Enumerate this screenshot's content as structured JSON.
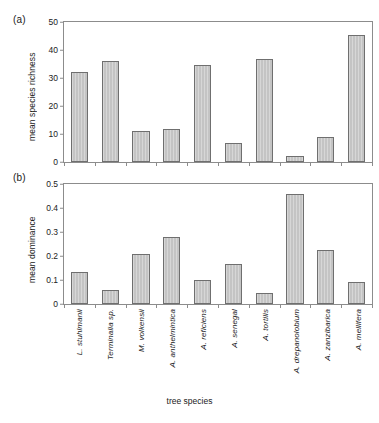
{
  "figure": {
    "panel_a_letter": "(a)",
    "panel_b_letter": "(b)",
    "xtitle": "tree species",
    "bar_color": "#c4c4c4",
    "bar_edge_color": "#6f6f6f",
    "axis_color": "#8c8c8c"
  },
  "chart_data": [
    {
      "type": "bar",
      "panel": "(a)",
      "title": "",
      "xlabel": "tree species",
      "ylabel": "mean species richness",
      "ylim": [
        0,
        50
      ],
      "yticks": [
        0,
        10,
        20,
        30,
        40,
        50
      ],
      "ytick_labels": [
        "0",
        "10",
        "20",
        "30",
        "40",
        "50"
      ],
      "grid": false,
      "legend": "none",
      "categories": [
        "L. stuhlmanii",
        "Terminalia sp.",
        "M. volkensii",
        "A. anthelmintica",
        "A. reficiens",
        "A. senegal",
        "A. tortilis",
        "A. drepanolobium",
        "A. zanzibarica",
        "A. mellifera"
      ],
      "values": [
        32.0,
        36.0,
        11.0,
        11.9,
        34.8,
        6.8,
        36.8,
        2.2,
        9.0,
        45.5
      ]
    },
    {
      "type": "bar",
      "panel": "(b)",
      "title": "",
      "xlabel": "tree species",
      "ylabel": "mean dominance",
      "ylim": [
        0,
        0.5
      ],
      "yticks": [
        0,
        0.1,
        0.2,
        0.3,
        0.4,
        0.5
      ],
      "ytick_labels": [
        "0",
        "0.1",
        "0.2",
        "0.3",
        "0.4",
        "0.5"
      ],
      "grid": false,
      "legend": "none",
      "categories": [
        "L. stuhlmanii",
        "Terminalia sp.",
        "M. volkensii",
        "A. anthelmintica",
        "A. reficiens",
        "A. senegal",
        "A. tortilis",
        "A. drepanolobium",
        "A. zanzibarica",
        "A. mellifera"
      ],
      "values": [
        0.135,
        0.058,
        0.21,
        0.28,
        0.1,
        0.165,
        0.047,
        0.46,
        0.225,
        0.092
      ]
    }
  ]
}
